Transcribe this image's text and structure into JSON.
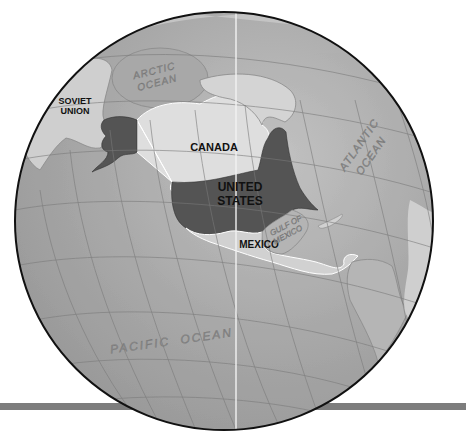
{
  "map": {
    "type": "orthographic-globe",
    "colors": {
      "background": "#ffffff",
      "ocean": "#a3a3a3",
      "ocean_light": "#bdbdbd",
      "land_other": "#c9c9c9",
      "land_ice": "#d8d8d8",
      "united_states": "#555555",
      "canada": "#dedede",
      "mexico": "#d2d2d2",
      "graticule": "#7a7a7a",
      "outline": "#111111",
      "bar": "#7d7d7d",
      "meridian_line": "#f2f2f2"
    },
    "labels": {
      "soviet_union_1": "SOVIET",
      "soviet_union_2": "UNION",
      "canada": "CANADA",
      "united_states_1": "UNITED",
      "united_states_2": "STATES",
      "mexico": "MEXICO",
      "arctic_ocean_1": "ARCTIC",
      "arctic_ocean_2": "OCEAN",
      "atlantic_ocean_1": "ATLANTIC",
      "atlantic_ocean_2": "OCEAN",
      "gulf_of_mexico_1": "GULF OF",
      "gulf_of_mexico_2": "MEXICO",
      "pacific_ocean": "PACIFIC  OCEAN"
    }
  }
}
